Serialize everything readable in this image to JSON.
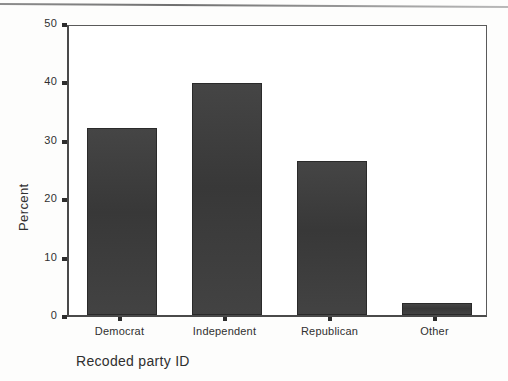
{
  "figure": {
    "background_color": "#ffffff",
    "bar_color": "#3b3b3b",
    "axis_color": "#4a4a4a",
    "top_rule_name": "page-rule"
  },
  "chart_data": {
    "type": "bar",
    "title": "",
    "xlabel": "Recoded party ID",
    "ylabel": "Percent",
    "categories": [
      "Democrat",
      "Independent",
      "Republican",
      "Other"
    ],
    "values": [
      32.1,
      39.7,
      26.3,
      2.1
    ],
    "ylim": [
      0,
      50
    ],
    "yticks": [
      0,
      10,
      20,
      30,
      40,
      50
    ],
    "ytick_labels": [
      "0",
      "10",
      "20",
      "30",
      "40",
      "50"
    ],
    "grid": false,
    "legend": "none",
    "series": [
      {
        "name": "Percent",
        "values": [
          32.1,
          39.7,
          26.3,
          2.1
        ]
      }
    ]
  }
}
